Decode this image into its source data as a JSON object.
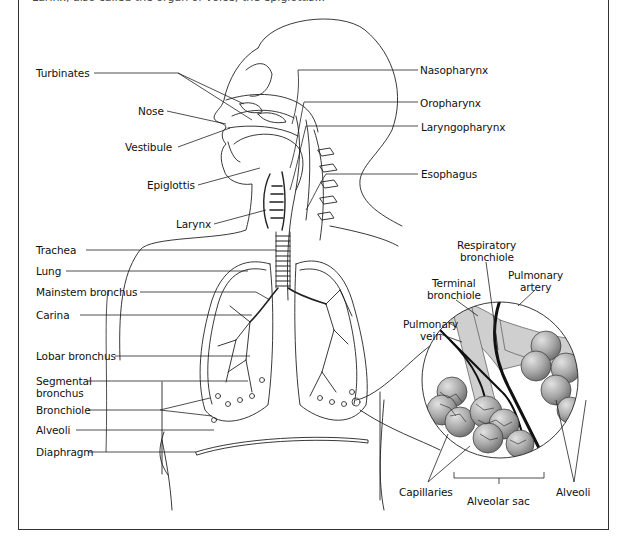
{
  "caption_partial": "Larinx, also called the organ of voice; the epiglottis...",
  "figure": {
    "left_labels": [
      {
        "text": "Turbinates",
        "x": 36,
        "y": 68,
        "name": "label-turbinates"
      },
      {
        "text": "Nose",
        "x": 138,
        "y": 106,
        "name": "label-nose"
      },
      {
        "text": "Vestibule",
        "x": 125,
        "y": 142,
        "name": "label-vestibule"
      },
      {
        "text": "Epiglottis",
        "x": 147,
        "y": 180,
        "name": "label-epiglottis"
      },
      {
        "text": "Larynx",
        "x": 176,
        "y": 219,
        "name": "label-larynx"
      },
      {
        "text": "Trachea",
        "x": 36,
        "y": 245,
        "name": "label-trachea"
      },
      {
        "text": "Lung",
        "x": 36,
        "y": 266,
        "name": "label-lung"
      },
      {
        "text": "Mainstem bronchus",
        "x": 36,
        "y": 287,
        "name": "label-mainstem-bronchus"
      },
      {
        "text": "Carina",
        "x": 36,
        "y": 310,
        "name": "label-carina"
      },
      {
        "text": "Lobar bronchus",
        "x": 36,
        "y": 351,
        "name": "label-lobar-bronchus"
      },
      {
        "text": "Segmental",
        "x": 36,
        "y": 376,
        "name": "label-segmental"
      },
      {
        "text": "bronchus",
        "x": 36,
        "y": 388,
        "name": "label-segmental-2"
      },
      {
        "text": "Bronchiole",
        "x": 36,
        "y": 405,
        "name": "label-bronchiole"
      },
      {
        "text": "Alveoli",
        "x": 36,
        "y": 425,
        "name": "label-alveoli-left"
      },
      {
        "text": "Diaphragm",
        "x": 36,
        "y": 447,
        "name": "label-diaphragm"
      }
    ],
    "right_labels": [
      {
        "text": "Nasopharynx",
        "x": 420,
        "y": 65,
        "name": "label-nasopharynx"
      },
      {
        "text": "Oropharynx",
        "x": 420,
        "y": 98,
        "name": "label-oropharynx"
      },
      {
        "text": "Laryngopharynx",
        "x": 421,
        "y": 122,
        "name": "label-laryngopharynx"
      },
      {
        "text": "Esophagus",
        "x": 421,
        "y": 169,
        "name": "label-esophagus"
      }
    ],
    "inset_labels": [
      {
        "text": "Respiratory",
        "x": 457,
        "y": 240,
        "name": "label-respiratory"
      },
      {
        "text": "bronchiole",
        "x": 460,
        "y": 252,
        "name": "label-respiratory-2"
      },
      {
        "text": "Pulmonary",
        "x": 508,
        "y": 270,
        "name": "label-pulmonary-artery"
      },
      {
        "text": "artery",
        "x": 520,
        "y": 282,
        "name": "label-pulmonary-artery-2"
      },
      {
        "text": "Terminal",
        "x": 432,
        "y": 278,
        "name": "label-terminal"
      },
      {
        "text": "bronchiole",
        "x": 427,
        "y": 290,
        "name": "label-terminal-2"
      },
      {
        "text": "Pulmonary",
        "x": 403,
        "y": 319,
        "name": "label-pulmonary-vein"
      },
      {
        "text": "vein",
        "x": 420,
        "y": 331,
        "name": "label-pulmonary-vein-2"
      },
      {
        "text": "Capillaries",
        "x": 399,
        "y": 487,
        "name": "label-capillaries"
      },
      {
        "text": "Alveolar sac",
        "x": 467,
        "y": 496,
        "name": "label-alveolar-sac"
      },
      {
        "text": "Alveoli",
        "x": 556,
        "y": 487,
        "name": "label-alveoli-right"
      }
    ]
  },
  "colors": {
    "line": "#222222",
    "frame": "#333333",
    "inset_fill": "#c9c9c9",
    "alveoli_fill": "#9a9a9a",
    "vessel": "#111111"
  }
}
